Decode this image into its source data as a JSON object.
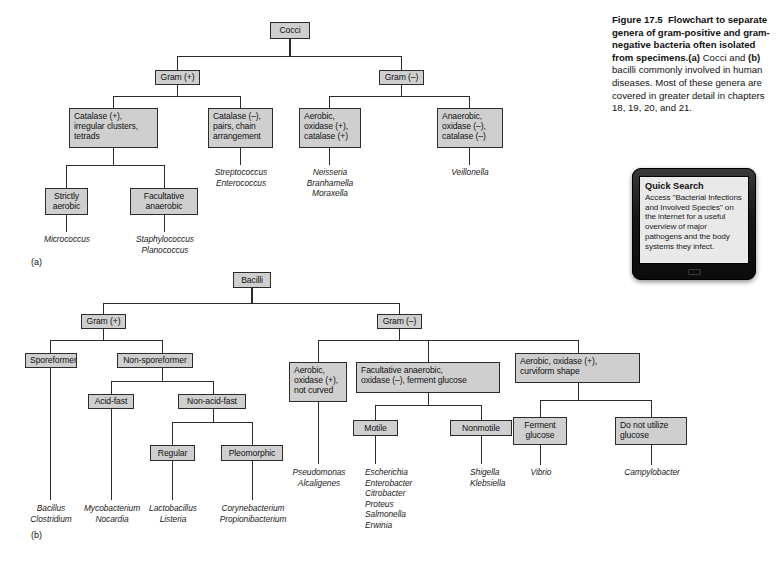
{
  "figure": {
    "number": "Figure 17.5",
    "title_bold": "Flowchart to separate genera of gram-positive and gram-negative bacteria often isolated from specimens.",
    "body_a_marker": "(a)",
    "body_part1": " Cocci and ",
    "body_b_marker": "(b)",
    "body_part2": " bacilli commonly involved in human diseases. Most of these genera are covered in greater detail in chapters 18, 19, 20, and 21."
  },
  "quick_search": {
    "title": "Quick Search",
    "body": "Access \"Bacterial Infections and Involved Species\" on the internet for a useful overview of major pathogens and the body systems they infect."
  },
  "panels": {
    "a_label": "(a)",
    "b_label": "(b)"
  },
  "cocci": {
    "root": "Cocci",
    "gram_pos": "Gram (+)",
    "gram_neg": "Gram (–)",
    "catalase_pos": "Catalase (+),\nirregular clusters,\ntetrads",
    "catalase_neg": "Catalase (–),\npairs, chain\narrangement",
    "aerobic_ox_pos": "Aerobic,\noxidase (+),\ncatalase (+)",
    "anaerobic_ox_neg": "Anaerobic,\noxidase (–),\ncatalase (–)",
    "strictly_aerobic": "Strictly\naerobic",
    "facultative_anaerobic": "Facultative\nanaerobic",
    "genera": {
      "micrococcus": "Micrococcus",
      "staph_plano": "Staphylococcus\nPlanococcus",
      "strep_entero": "Streptococcus\nEnterococcus",
      "neisseria_group": "Neisseria\nBranhamella\nMoraxella",
      "veillonella": "Veillonella"
    }
  },
  "bacilli": {
    "root": "Bacilli",
    "gram_pos": "Gram (+)",
    "gram_neg": "Gram (–)",
    "sporeformer": "Sporeformer",
    "non_sporeformer": "Non-sporeformer",
    "acid_fast": "Acid-fast",
    "non_acid_fast": "Non-acid-fast",
    "regular": "Regular",
    "pleomorphic": "Pleomorphic",
    "aerobic_not_curved": "Aerobic,\noxidase (+),\nnot curved",
    "facultative_ferment": "Facultative anaerobic,\noxidase (–), ferment glucose",
    "aerobic_curviform": "Aerobic, oxidase (+),\ncurviform shape",
    "motile": "Motile",
    "nonmotile": "Nonmotile",
    "ferment_glucose": "Ferment\nglucose",
    "no_glucose": "Do not utilize\nglucose",
    "genera": {
      "bacillus_clostridium": "Bacillus\nClostridium",
      "myco_nocardia": "Mycobacterium\nNocardia",
      "lacto_listeria": "Lactobacillus\nListeria",
      "coryne_propioni": "Corynebacterium\nPropionibacterium",
      "pseudomonas_alcaligenes": "Pseudomonas\nAlcaligenes",
      "enterics": "Escherichia\nEnterobacter\nCitrobacter\nProteus\nSalmonella\nErwinia",
      "shigella_klebsiella": "Shigella\nKlebsiella",
      "vibrio": "Vibrio",
      "campylobacter": "Campylobacter"
    }
  },
  "colors": {
    "box_fill": "#cfcfcf",
    "box_border": "#2b2b2b",
    "page_bg": "#ffffff",
    "tablet_body": "#141414",
    "screen_bg": "#e9e9e9"
  }
}
